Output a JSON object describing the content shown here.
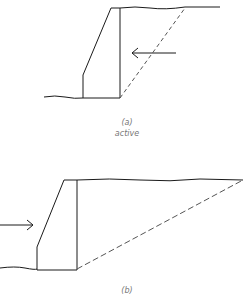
{
  "diagrams": [
    {
      "id": "a",
      "label": "(a)",
      "sublabel": "active",
      "arrow_direction": "left"
    },
    {
      "id": "b",
      "label": "(b)",
      "sublabel": "",
      "arrow_direction": "right"
    }
  ],
  "colors": {
    "line": "#1a1a1a",
    "dashed": "#555555",
    "caption": "#777777"
  }
}
